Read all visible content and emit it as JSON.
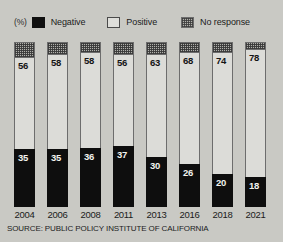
{
  "unit_label": "(%)",
  "legend": [
    {
      "key": "negative",
      "label": "Negative",
      "swatch": "solid-black-swatch",
      "color": "#0e0e0e"
    },
    {
      "key": "positive",
      "label": "Positive",
      "swatch": "outlined-white-swatch",
      "color": "#dcdcd8"
    },
    {
      "key": "no_response",
      "label": "No response",
      "swatch": "hatched-swatch",
      "color": "#b0b0ab"
    }
  ],
  "source": "SOURCE: PUBLIC POLICY INSTITUTE OF CALIFORNIA",
  "chart_data": {
    "type": "bar",
    "title": "",
    "subtitle": "",
    "xlabel": "",
    "ylabel": "(%)",
    "ylim": [
      0,
      100
    ],
    "grid": false,
    "stacked": true,
    "legend_position": "top",
    "categories": [
      "2004",
      "2006",
      "2008",
      "2011",
      "2013",
      "2016",
      "2018",
      "2021"
    ],
    "series": [
      {
        "name": "Negative",
        "values": [
          35,
          35,
          36,
          37,
          30,
          26,
          20,
          18
        ]
      },
      {
        "name": "Positive",
        "values": [
          56,
          58,
          58,
          56,
          63,
          68,
          74,
          78
        ]
      },
      {
        "name": "No response",
        "values": [
          9,
          7,
          6,
          7,
          7,
          6,
          6,
          4
        ]
      }
    ],
    "labeled_series": [
      "Negative",
      "Positive"
    ],
    "annotations": []
  }
}
